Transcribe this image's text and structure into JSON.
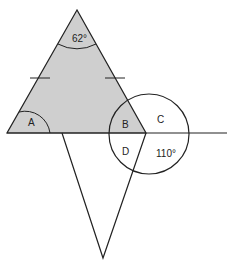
{
  "diagram": {
    "title": "",
    "colors": {
      "triangle_fill": "#cfcfcf",
      "stroke": "#222222",
      "background": "#ffffff"
    },
    "labels": {
      "apex_angle": "62°",
      "angle_a": "A",
      "angle_b": "B",
      "angle_c": "C",
      "angle_d": "D",
      "angle_110": "110°"
    },
    "shapes": {
      "upper_triangle": "isosceles, shaded, apex angle 62°, equal sides marked with tick marks",
      "lower_triangle": "unshaded, hanging below baseline",
      "circle": "centered at right base vertex, divides angles B, C, D, 110°",
      "baseline": "horizontal line through base"
    }
  }
}
